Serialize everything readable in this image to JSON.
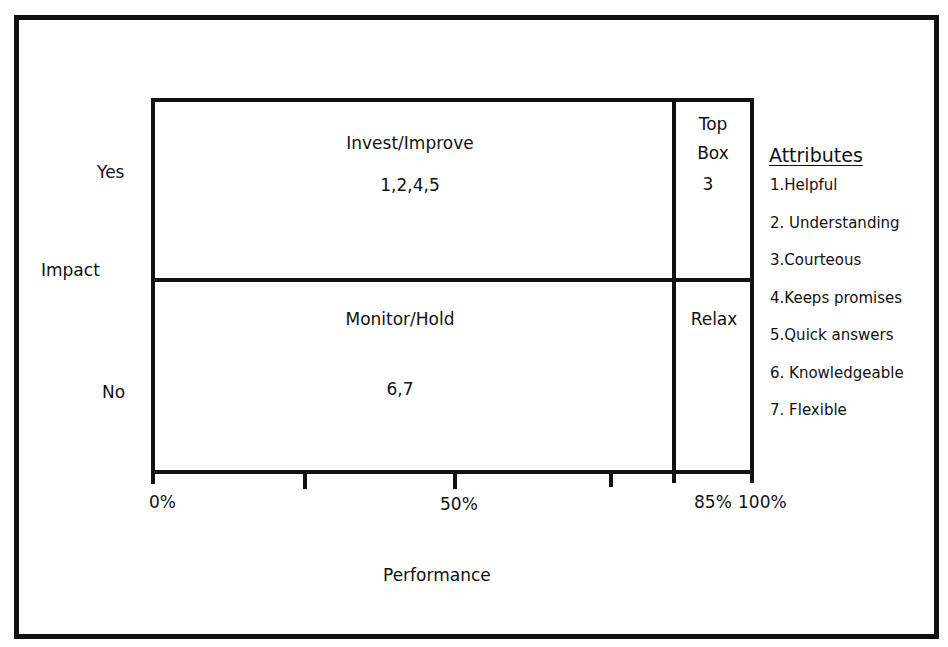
{
  "axes": {
    "y_label": "Impact",
    "y_ticks": [
      "Yes",
      "No"
    ],
    "x_label": "Performance",
    "x_ticks": [
      "0%",
      "50%",
      "85%",
      "100%"
    ]
  },
  "quadrants": {
    "invest": {
      "label": "Invest/Improve",
      "items": "1,2,4,5"
    },
    "topbox": {
      "label_line1": "Top",
      "label_line2": "Box",
      "items": "3"
    },
    "monitor": {
      "label": "Monitor/Hold",
      "items": "6,7"
    },
    "relax": {
      "label": "Relax",
      "items": ""
    }
  },
  "attributes": {
    "title": "Attributes",
    "items": [
      "1.Helpful",
      "2. Understanding",
      "3.Courteous",
      "4.Keeps promises",
      "5.Quick answers",
      "6. Knowledgeable",
      "7. Flexible"
    ]
  }
}
